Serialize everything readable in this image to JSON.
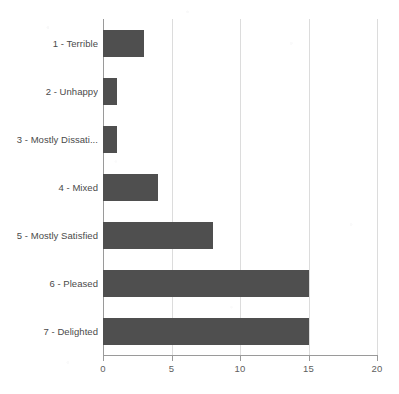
{
  "chart_data": {
    "type": "bar",
    "orientation": "horizontal",
    "title": "",
    "xlabel": "",
    "ylabel": "",
    "categories": [
      "1 - Terrible",
      "2 - Unhappy",
      "3 - Mostly Dissati...",
      "4 - Mixed",
      "5 - Mostly Satisfied",
      "6 - Pleased",
      "7 - Delighted"
    ],
    "values": [
      3,
      1,
      1,
      4,
      8,
      15,
      15
    ],
    "xlim": [
      0,
      20
    ],
    "xticks": [
      0,
      5,
      10,
      15,
      20
    ],
    "xtick_labels": [
      "0",
      "5",
      "10",
      "15",
      "20"
    ],
    "grid": "vertical",
    "legend": "none",
    "series": [
      {
        "name": "Responses",
        "values": [
          3,
          1,
          1,
          4,
          8,
          15,
          15
        ]
      }
    ]
  },
  "style": {
    "bar_color": "#4f4f4f",
    "gridline_color": "#dcdcdc",
    "axis_color": "#9a9a9a",
    "background_color": "#ffffff",
    "label_color": "#4a4a4a",
    "tick_label_color": "#5e5e5e"
  }
}
